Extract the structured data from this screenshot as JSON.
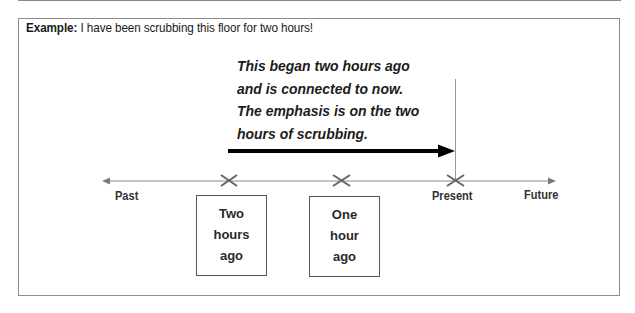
{
  "example": {
    "label": "Example:",
    "sentence": " I have been scrubbing this floor for two hours!"
  },
  "explanation": {
    "lines": [
      "This began two hours ago",
      "and is connected to now.",
      "The emphasis is on the two",
      "hours of scrubbing."
    ]
  },
  "timeline": {
    "labels": {
      "past": "Past",
      "present": "Present",
      "future": "Future"
    },
    "markers": [
      {
        "id": "two-hours-ago",
        "lines": [
          "Two",
          "hours",
          "ago"
        ]
      },
      {
        "id": "one-hour-ago",
        "lines": [
          "One",
          "hour",
          "ago"
        ]
      },
      {
        "id": "present"
      }
    ],
    "colors": {
      "axis": "#8a8a8a",
      "marker": "#666666",
      "duration_arrow": "#000000",
      "frame_border": "#8c8c8c"
    }
  }
}
